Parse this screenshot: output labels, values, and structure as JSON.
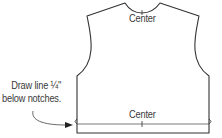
{
  "diagram": {
    "type": "sewing pattern piece - vest/bodice back",
    "labels": {
      "center_top": "Center",
      "center_bottom": "Center"
    },
    "annotation": {
      "line1": "Draw line ¼\"",
      "line2": "below notches."
    },
    "colors": {
      "stroke": "#333333",
      "text": "#3a3a3a",
      "background": "#ffffff"
    }
  }
}
